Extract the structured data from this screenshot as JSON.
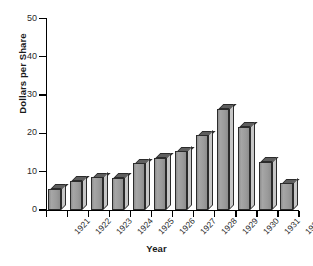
{
  "chart_data": {
    "type": "bar",
    "title": "",
    "subtitle": "",
    "xlabel": "Year",
    "ylabel": "Dollars per Share",
    "categories": [
      "1921",
      "1922",
      "1923",
      "1924",
      "1925",
      "1926",
      "1927",
      "1928",
      "1929",
      "1930",
      "1931",
      "1932"
    ],
    "values": [
      5.5,
      7.7,
      8.6,
      8.4,
      12.2,
      13.7,
      15.3,
      19.5,
      26.4,
      21.8,
      12.6,
      7.0
    ],
    "ylim": [
      0,
      50
    ],
    "yticks": [
      0,
      10,
      20,
      30,
      40,
      50
    ],
    "ytick_labels": [
      "0",
      "10",
      "20",
      "30",
      "40",
      "50"
    ],
    "grid": false,
    "legend": null,
    "style": "3d-bar",
    "bar_fill_color": "#9d9d9d",
    "bar_top_color": "#5e5e5e",
    "bar_side_color": "#c6c6c6",
    "bar_edge_color": "#2b2b2b",
    "axis_color": "#000000",
    "background_color": "#ffffff",
    "tick_label_rotation_deg": -47
  }
}
